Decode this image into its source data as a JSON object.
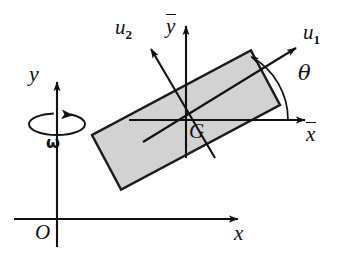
{
  "figure": {
    "background_color": "#ffffff",
    "line_color": "#111111",
    "body_fill_color": "#d2d2d2",
    "body_stroke_color": "#1a1a1a"
  },
  "labels": {
    "global_y": "y",
    "global_x": "x",
    "origin": "O",
    "angular_velocity": "ω",
    "body_x": "x",
    "body_y": "y",
    "axis_u1_base": "u",
    "axis_u1_sub": "1",
    "axis_u2_base": "u",
    "axis_u2_sub": "2",
    "center_of_mass": "G",
    "angle": "θ"
  },
  "geometry": {
    "global_origin": {
      "x": 57,
      "y": 219
    },
    "global_x_axis_end": {
      "x": 243,
      "y": 219
    },
    "global_y_axis_top": {
      "x": 57,
      "y": 76
    },
    "body_center_G": {
      "x": 186,
      "y": 120
    },
    "body_x_axis_end": {
      "x": 310,
      "y": 120
    },
    "body_y_axis_top": {
      "x": 186,
      "y": 20
    },
    "u1_arrow_tip": {
      "x": 301,
      "y": 44
    },
    "u2_arrow_tip": {
      "x": 147,
      "y": 44
    },
    "rectangle_rotation_deg": 28,
    "rectangle_length": 180,
    "rectangle_width": 62,
    "theta_arc_radius": 72,
    "omega_ellipse_center": {
      "x": 57,
      "y": 120
    },
    "omega_ellipse_rx": 28,
    "omega_ellipse_ry": 9
  }
}
